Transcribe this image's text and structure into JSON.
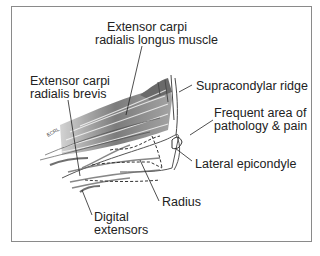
{
  "figure": {
    "labels": {
      "ecrl": [
        "Extensor carpi",
        "radialis longus muscle"
      ],
      "ecrb": [
        "Extensor carpi",
        "radialis brevis"
      ],
      "supracondylar": "Supracondylar ridge",
      "pathology": [
        "Frequent area of",
        "pathology & pain"
      ],
      "epicondyle": "Lateral epicondyle",
      "radius": "Radius",
      "digital": [
        "Digital",
        "extensors"
      ]
    },
    "colors": {
      "border": "#8a8a8a",
      "ink": "#222222",
      "muscle_dark": "#3a3a3a",
      "muscle_mid": "#7a7a7a",
      "muscle_light": "#b8b8b8"
    }
  }
}
